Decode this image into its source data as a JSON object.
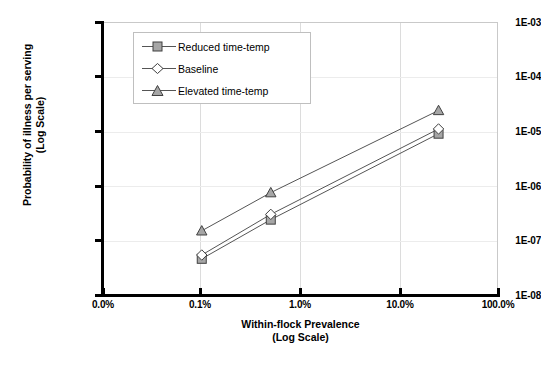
{
  "chart_data": {
    "type": "line",
    "title": "",
    "xlabel": "Within-flock Prevalence (Log Scale)",
    "ylabel": "Probability of illness per serving (Log Scale)",
    "xlabel_line1": "Within-flock Prevalence",
    "xlabel_line2": "(Log Scale)",
    "ylabel_line1": "Probability of illness per serving",
    "ylabel_line2": "(Log Scale)",
    "xscale": "log",
    "yscale": "log",
    "xlim": [
      0.0001,
      1.0
    ],
    "ylim": [
      1e-08,
      0.001
    ],
    "grid": true,
    "legend_position": "upper-left-inside",
    "x_tick_labels": [
      "0.0%",
      "0.1%",
      "1.0%",
      "10.0%",
      "100.0%"
    ],
    "x_tick_values": [
      0.0001,
      0.001,
      0.01,
      0.1,
      1.0
    ],
    "y_tick_labels": [
      "1E-03",
      "1E-04",
      "1E-05",
      "1E-06",
      "1E-07",
      "1E-08"
    ],
    "y_tick_values": [
      0.001,
      0.0001,
      1e-05,
      1e-06,
      1e-07,
      1e-08
    ],
    "x": [
      0.001,
      0.005,
      0.25
    ],
    "series": [
      {
        "name": "Reduced time-temp",
        "marker": "square",
        "values": [
          4.6e-08,
          2.4e-07,
          9e-06
        ]
      },
      {
        "name": "Baseline",
        "marker": "diamond",
        "values": [
          5.4e-08,
          3e-07,
          1.1e-05
        ]
      },
      {
        "name": "Elevated time-temp",
        "marker": "triangle",
        "values": [
          1.5e-07,
          7.5e-07,
          2.4e-05
        ]
      }
    ],
    "colors": {
      "line": "#555555",
      "marker_fill": "#a6a6a6",
      "marker_stroke": "#404040",
      "axis": "#000000",
      "plot_border": "#c9c9c9",
      "gridline": "#dcdcdc",
      "background": "#ffffff"
    }
  },
  "legend": {
    "items": [
      {
        "label": "Reduced time-temp",
        "marker": "square"
      },
      {
        "label": "Baseline",
        "marker": "diamond"
      },
      {
        "label": "Elevated time-temp",
        "marker": "triangle"
      }
    ]
  },
  "axes": {
    "y_ticks": [
      "1E-03",
      "1E-04",
      "1E-05",
      "1E-06",
      "1E-07",
      "1E-08"
    ],
    "x_ticks": [
      "0.0%",
      "0.1%",
      "1.0%",
      "10.0%",
      "100.0%"
    ],
    "y_title_line1": "Probability of illness per serving",
    "y_title_line2": "(Log Scale)",
    "x_title_line1": "Within-flock Prevalence",
    "x_title_line2": "(Log Scale)"
  }
}
